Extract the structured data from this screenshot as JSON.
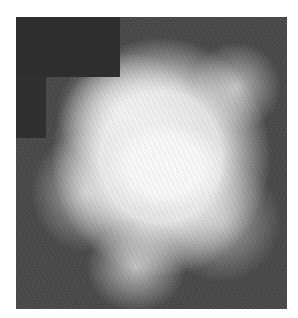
{
  "image": {
    "subject": "grayscale nebula photograph",
    "colors": {
      "background": "#4a4a4a",
      "core": "#ffffff",
      "mask_block": "#2e2e2e",
      "page": "#ffffff"
    }
  }
}
